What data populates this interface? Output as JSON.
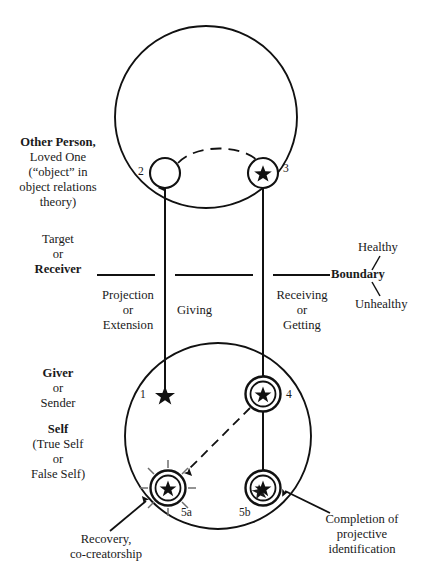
{
  "diagram": {
    "stroke_color": "#111111",
    "background_color": "#ffffff"
  },
  "labels": {
    "other_person": {
      "line1": "Other Person,",
      "line2": "Loved One",
      "line3": "(“object” in",
      "line4": "object relations",
      "line5": "theory)"
    },
    "target_receiver": {
      "line1": "Target",
      "line2": "or",
      "line3": "Receiver"
    },
    "giver_sender": {
      "line1": "Giver",
      "line2": "or",
      "line3": "Sender"
    },
    "self": {
      "line1": "Self",
      "line2": "(True Self",
      "line3": "or",
      "line4": "False Self)"
    },
    "boundary": "Boundary",
    "healthy": "Healthy",
    "unhealthy": "Unhealthy",
    "projection": {
      "line1": "Projection",
      "line2": "or",
      "line3": "Extension"
    },
    "giving": "Giving",
    "receiving": {
      "line1": "Receiving",
      "line2": "or",
      "line3": "Getting"
    },
    "recovery": {
      "line1": "Recovery,",
      "line2": "co-creatorship"
    },
    "completion": {
      "line1": "Completion of",
      "line2": "projective",
      "line3": "identification"
    }
  },
  "nodes": [
    {
      "id": "1",
      "label": "1",
      "kind": "star-only",
      "cx": 165,
      "cy": 394
    },
    {
      "id": "2",
      "label": "2",
      "kind": "empty-circle",
      "cx": 165,
      "cy": 173
    },
    {
      "id": "3",
      "label": "3",
      "kind": "circle-star",
      "cx": 263,
      "cy": 173
    },
    {
      "id": "4",
      "label": "4",
      "kind": "double-circle-star",
      "cx": 263,
      "cy": 394
    },
    {
      "id": "5a",
      "label": "5a",
      "kind": "double-circle-star-rays",
      "cx": 168,
      "cy": 488
    },
    {
      "id": "5b",
      "label": "5b",
      "kind": "double-circle-star-filled",
      "cx": 263,
      "cy": 488
    }
  ],
  "connectors": [
    {
      "name": "projection-arrow-up",
      "from": "1",
      "to": "2",
      "style": "solid",
      "direction": "up"
    },
    {
      "name": "giving-arrow-down",
      "from": "3",
      "to": "4",
      "style": "solid",
      "direction": "down"
    },
    {
      "name": "dashed-arc-2-to-3",
      "from": "2",
      "to": "3",
      "style": "dashed",
      "direction": "arc"
    },
    {
      "name": "dashed-arrow-4-to-5a",
      "from": "4",
      "to": "5a",
      "style": "dashed",
      "direction": "down-left"
    },
    {
      "name": "solid-arrow-4-to-5b",
      "from": "4",
      "to": "5b",
      "style": "solid",
      "direction": "down"
    },
    {
      "name": "recovery-pointer",
      "from": "recovery-label",
      "to": "5a",
      "style": "solid",
      "direction": "up-right"
    },
    {
      "name": "completion-pointer",
      "from": "completion-label",
      "to": "5b",
      "style": "solid",
      "direction": "up-left"
    }
  ],
  "shapes": {
    "other_person_circle": {
      "cx": 206,
      "cy": 117,
      "r": 91
    },
    "self_circle": {
      "cx": 218,
      "cy": 436,
      "r": 93
    },
    "boundary_segments": 3
  }
}
